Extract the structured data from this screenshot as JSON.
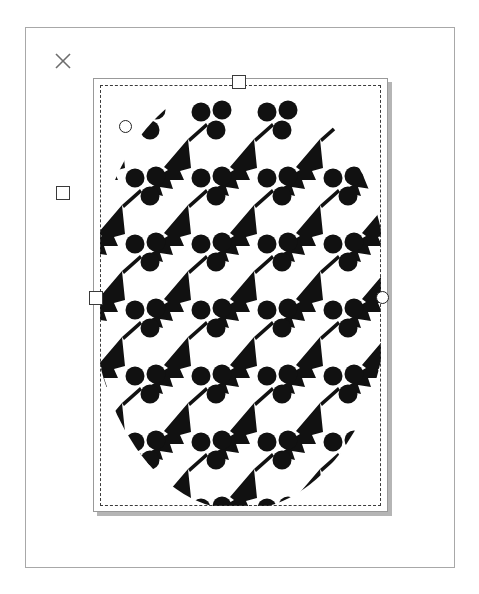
{
  "app": {
    "background_color": "#ffffff",
    "canvas": {
      "border_color": "#a8a8a8",
      "x": 25,
      "y": 27,
      "width": 430,
      "height": 541
    }
  },
  "markers": {
    "close_icon": "close-x-icon",
    "close_color": "#6d6d6d",
    "detached_square_handle": "square-handle",
    "handle_fill": "#ffffff",
    "handle_stroke": "#3a3a3a"
  },
  "selection": {
    "frame": {
      "x": 93,
      "y": 78,
      "width": 295,
      "height": 434
    },
    "dashed_rect": {
      "x": 100,
      "y": 85,
      "width": 281,
      "height": 421
    },
    "dash_color": "#3b3b3b",
    "shadow_color": "rgba(120,120,120,0.55)",
    "handles": [
      {
        "name": "top-center",
        "shape": "square",
        "x": 232,
        "y": 75
      },
      {
        "name": "middle-left",
        "shape": "square",
        "x": 89,
        "y": 291
      },
      {
        "name": "middle-right",
        "shape": "circle",
        "x": 376,
        "y": 291
      }
    ]
  },
  "artwork": {
    "name": "fern-berry-repeat-pattern",
    "description": "Black and white repeating motif of an arrowhead fern leaf with a stem and three round berries, clipped to an ellipse",
    "ink_color": "#111111",
    "paper_color": "#ffffff",
    "clip_shape": "ellipse",
    "clip": {
      "cx": 140,
      "cy": 210,
      "rx": 148,
      "ry": 215
    },
    "grid": {
      "columns": 5,
      "rows": 7,
      "step_x": 66,
      "step_y": 66,
      "row_offset_x": 0,
      "rotation_deg": 0
    },
    "motif": {
      "leaf_shape": "arrowhead-fern",
      "berry_count": 3,
      "berry_radius": 9.5,
      "stem": true
    },
    "marker_circle_in_pattern": {
      "x": 119,
      "y": 120,
      "shape": "circle"
    }
  }
}
